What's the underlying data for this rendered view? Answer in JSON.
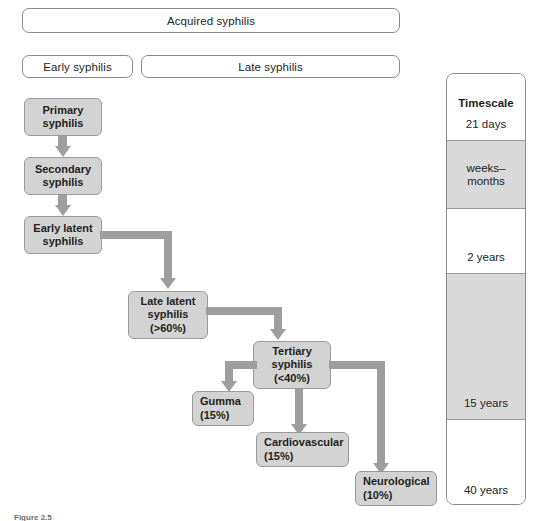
{
  "figure": {
    "caption": "Figure 2.5"
  },
  "header": {
    "acquired": "Acquired syphilis",
    "early": "Early syphilis",
    "late": "Late syphilis"
  },
  "stages": {
    "primary": {
      "line1": "Primary",
      "line2": "syphilis"
    },
    "secondary": {
      "line1": "Secondary",
      "line2": "syphilis"
    },
    "early_latent": {
      "line1": "Early latent",
      "line2": "syphilis"
    },
    "late_latent": {
      "line1": "Late latent",
      "line2": "syphilis",
      "line3": "(>60%)"
    },
    "tertiary": {
      "line1": "Tertiary",
      "line2": "syphilis",
      "line3": "(<40%)"
    },
    "gumma": {
      "line1": "Gumma",
      "line2": "(15%)"
    },
    "cardiovascular": {
      "line1": "Cardiovascular",
      "line2": "(15%)"
    },
    "neurological": {
      "line1": "Neurological",
      "line2": "(10%)"
    }
  },
  "timescale": {
    "title": "Timescale",
    "bands": [
      {
        "label": "21 days"
      },
      {
        "label": "weeks–\nmonths"
      },
      {
        "label": "2 years"
      },
      {
        "label": "15 years"
      },
      {
        "label": "40 years"
      }
    ]
  },
  "colors": {
    "box_fill": "#d3d3d3",
    "box_border": "#9a9a9a",
    "connector": "#9e9e9e",
    "band_shade": "#d9d9d9",
    "text": "#231f20"
  }
}
